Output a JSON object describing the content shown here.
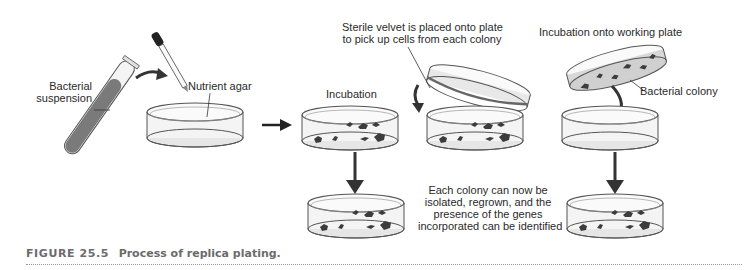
{
  "figure": {
    "caption_number": "FIGURE 25.5",
    "caption_text": "Process of replica plating.",
    "labels": {
      "bacterial_suspension_line1": "Bacterial",
      "bacterial_suspension_line2": "suspension",
      "nutrient_agar": "Nutrient agar",
      "incubation": "Incubation",
      "velvet_line1": "Sterile velvet is placed onto plate",
      "velvet_line2": "to pick up cells from each colony",
      "working_plate": "Incubation onto working plate",
      "bacterial_colony": "Bacterial colony",
      "result_line1": "Each colony can now be",
      "result_line2": "isolated, regrown, and the",
      "result_line3": "presence of the genes",
      "result_line4": "incorporated can be identified"
    },
    "colors": {
      "line": "#3a3a3a",
      "dish_fill": "#f2f2f2",
      "agar": "#d9d9d9",
      "colony": "#3c3c3c",
      "arrow": "#333333",
      "caption": "#6b6b6b"
    }
  }
}
